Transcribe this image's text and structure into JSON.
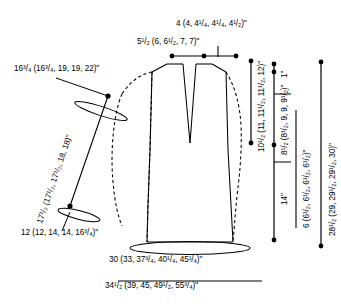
{
  "diagram": {
    "type": "sewing-knitting-schematic",
    "units": "inches",
    "size_count": 5,
    "stroke_color": "#000000",
    "background_color": "#ffffff"
  },
  "measurements": {
    "shoulder_width": {
      "text": "4 (4, 4¹/₄, 4¹/₄, 4¹/₂)\"",
      "base": "4",
      "values": [
        "4",
        "4",
        "4 1/4",
        "4 1/4",
        "4 1/2"
      ],
      "position": "top-center"
    },
    "neck_width": {
      "text": "5¹/₂ (6, 6¹/₂, 7, 7)\"",
      "base": "5 1/2",
      "values": [
        "5 1/2",
        "6",
        "6 1/2",
        "7",
        "7"
      ],
      "position": "top-center-left"
    },
    "upper_sleeve_width": {
      "text": "16³/₄ (16³/₄, 19, 19, 22)\"",
      "base": "16 3/4",
      "values": [
        "16 3/4",
        "16 3/4",
        "19",
        "19",
        "22"
      ],
      "position": "upper-left"
    },
    "sleeve_length": {
      "text": "17¹/₂ (17¹/₂, 17¹/₂, 18, 18)\"",
      "base": "17 1/2",
      "values": [
        "17 1/2",
        "17 1/2",
        "17 1/2",
        "18",
        "18"
      ],
      "position": "left-diagonal"
    },
    "cuff_width": {
      "text": "12 (12, 14, 14, 16³/₄)\"",
      "base": "12",
      "values": [
        "12",
        "12",
        "14",
        "14",
        "16 3/4"
      ],
      "position": "lower-left"
    },
    "hip_width": {
      "text": "30 (33, 37³/₄, 40¹/₄, 45¹/₄)\"",
      "base": "30",
      "values": [
        "30",
        "33",
        "37 3/4",
        "40 1/4",
        "45 1/4"
      ],
      "position": "bottom-upper"
    },
    "hem_width": {
      "text": "34¹/₂ (39, 45, 49¹/₂, 55³/₄)\"",
      "base": "34 1/2",
      "values": [
        "34 1/2",
        "39",
        "45",
        "49 1/2",
        "55 3/4"
      ],
      "position": "bottom"
    },
    "yoke_depth": {
      "text": "10¹/₂ (11, 11¹/₂, 11¹/₂, 12)\"",
      "base": "10 1/2",
      "values": [
        "10 1/2",
        "11",
        "11 1/2",
        "11 1/2",
        "12"
      ],
      "position": "right-column-1"
    },
    "edge_band": {
      "text": "1\"",
      "base": "1",
      "values": [
        "1"
      ],
      "position": "right-column-2-top"
    },
    "armhole_depth": {
      "text": "8¹/₂ (8¹/₂, 9, 9, 9¹/₂)\"",
      "base": "8 1/2",
      "values": [
        "8 1/2",
        "8 1/2",
        "9",
        "9",
        "9 1/2"
      ],
      "position": "right-column-2"
    },
    "waist_to_hip": {
      "text": "14\"",
      "base": "14",
      "values": [
        "14"
      ],
      "position": "right-column-2-bottom"
    },
    "side_seam": {
      "text": "6 (6¹/₂, 6¹/₂, 6¹/₂, 6¹/₂)\"",
      "base": "6",
      "values": [
        "6",
        "6 1/2",
        "6 1/2",
        "6 1/2",
        "6 1/2"
      ],
      "position": "right-column-3"
    },
    "total_length": {
      "text": "28¹/₂ (29, 29¹/₂, 29¹/₂, 30)\"",
      "base": "28 1/2",
      "values": [
        "28 1/2",
        "29",
        "29 1/2",
        "29 1/2",
        "30"
      ],
      "position": "right-column-4"
    }
  }
}
